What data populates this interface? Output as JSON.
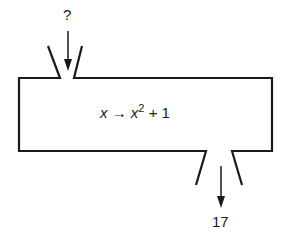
{
  "diagram": {
    "type": "function-machine",
    "input_label": "?",
    "output_label": "17",
    "rule": {
      "variable": "x",
      "arrow": "→",
      "output_var": "x",
      "exponent": "2",
      "suffix": "+ 1"
    },
    "colors": {
      "stroke": "#1a1a1a",
      "background": "#ffffff"
    }
  }
}
